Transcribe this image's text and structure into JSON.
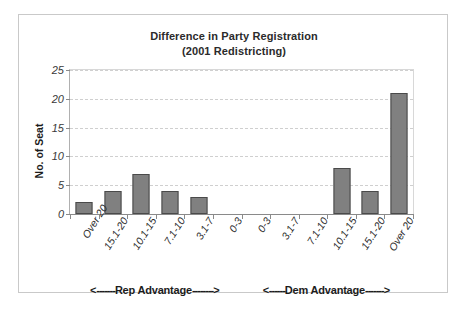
{
  "chart_data": {
    "type": "bar",
    "title": "Difference in Party Registration",
    "subtitle": "(2001 Redistricting)",
    "xlabel": "",
    "ylabel": "No. of Seat",
    "ylim": [
      0,
      25
    ],
    "yticks": [
      0,
      5,
      10,
      15,
      20,
      25
    ],
    "grid": true,
    "legend": false,
    "categories": [
      "Over 20",
      "15.1-20",
      "10.1-15",
      "7.1-10",
      "3.1-7",
      "0-3",
      "0-3",
      "3.1-7",
      "7.1-10",
      "10.1-15",
      "15.1-20",
      "Over 20"
    ],
    "values": [
      2,
      4,
      7,
      4,
      3,
      0,
      0,
      0,
      0,
      8,
      4,
      21
    ],
    "bar_color": "#808080",
    "bar_border_color": "#4a4a4a",
    "annotations": [
      {
        "text": "Rep Advantage",
        "arrow_left": "<",
        "arrow_right": ">",
        "dashes_left": "-------",
        "dashes_right": "--------"
      },
      {
        "text": "Dem Advantage",
        "arrow_left": "<",
        "arrow_right": ">",
        "dashes_left": "------",
        "dashes_right": "-------"
      }
    ]
  },
  "y_tick_labels": [
    "0",
    "5",
    "10",
    "15",
    "20",
    "25"
  ],
  "title": {
    "line1": "Difference in Party Registration",
    "line2": "(2001 Redistricting)"
  },
  "axis": {
    "y_title": "No. of Seat"
  }
}
